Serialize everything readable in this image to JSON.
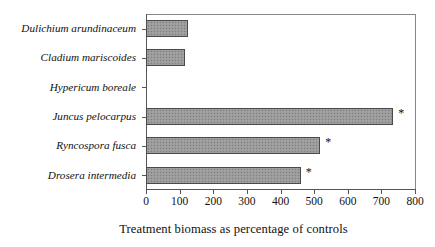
{
  "chart_data": {
    "type": "bar",
    "orientation": "horizontal",
    "title": "",
    "xlabel": "Treatment biomass as percentage of controls",
    "ylabel": "",
    "xlim": [
      0,
      800
    ],
    "xticks": [
      0,
      100,
      200,
      300,
      400,
      500,
      600,
      700,
      800
    ],
    "xticklabels": [
      "0",
      "100",
      "200",
      "300",
      "400",
      "500",
      "600",
      "700",
      "800"
    ],
    "grid": false,
    "legend": null,
    "categories": [
      "Dulichium arundinaceum",
      "Cladium mariscoides",
      "Hypericum boreale",
      "Juncus pelocarpus",
      "Ryncospora fusca",
      "Drosera intermedia"
    ],
    "values": [
      125,
      116,
      0,
      735,
      518,
      460
    ],
    "annotations": [
      "",
      "",
      "",
      "*",
      "*",
      "*"
    ],
    "bars": [
      {
        "category": "Dulichium arundinaceum",
        "value": 125,
        "annotation": ""
      },
      {
        "category": "Cladium mariscoides",
        "value": 116,
        "annotation": ""
      },
      {
        "category": "Hypericum boreale",
        "value": 0,
        "annotation": ""
      },
      {
        "category": "Juncus pelocarpus",
        "value": 735,
        "annotation": "*"
      },
      {
        "category": "Ryncospora fusca",
        "value": 518,
        "annotation": "*"
      },
      {
        "category": "Drosera intermedia",
        "value": 460,
        "annotation": "*"
      }
    ],
    "colors": {
      "bar_fill": "#9a9a9a",
      "bar_border": "#4a4a4a",
      "axis": "#555555",
      "text": "#111111",
      "background": "#ffffff"
    }
  }
}
